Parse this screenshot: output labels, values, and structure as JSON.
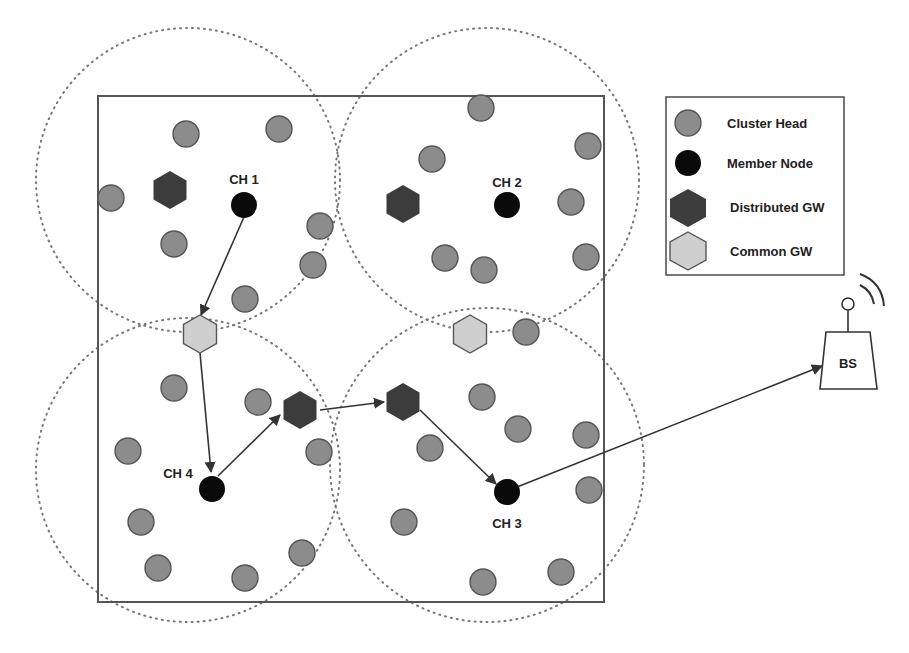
{
  "diagram": {
    "type": "wsn-cluster-routing",
    "field": {
      "x": 98,
      "y": 96,
      "w": 506,
      "h": 506
    },
    "colors": {
      "cluster_head": "#8c8c8c",
      "member_node": "#0a0a0a",
      "distributed_gw": "#3c3c3c",
      "common_gw": "#cfcfcf",
      "stroke": "#444444"
    },
    "ranges": [
      {
        "cx": 188,
        "cy": 180,
        "r": 152
      },
      {
        "cx": 487,
        "cy": 180,
        "r": 152
      },
      {
        "cx": 188,
        "cy": 470,
        "r": 152
      },
      {
        "cx": 487,
        "cy": 465,
        "r": 157
      }
    ],
    "gray_nodes": [
      [
        186,
        134
      ],
      [
        279,
        129
      ],
      [
        111,
        198
      ],
      [
        174,
        244
      ],
      [
        320,
        226
      ],
      [
        313,
        265
      ],
      [
        245,
        299
      ],
      [
        481,
        108
      ],
      [
        432,
        159
      ],
      [
        588,
        146
      ],
      [
        571,
        202
      ],
      [
        445,
        258
      ],
      [
        484,
        270
      ],
      [
        586,
        257
      ],
      [
        526,
        332
      ],
      [
        174,
        388
      ],
      [
        258,
        402
      ],
      [
        128,
        451
      ],
      [
        319,
        452
      ],
      [
        141,
        522
      ],
      [
        158,
        568
      ],
      [
        245,
        578
      ],
      [
        302,
        553
      ],
      [
        482,
        397
      ],
      [
        518,
        429
      ],
      [
        586,
        435
      ],
      [
        430,
        448
      ],
      [
        589,
        490
      ],
      [
        404,
        522
      ],
      [
        483,
        582
      ],
      [
        561,
        572
      ]
    ],
    "cluster_heads": [
      {
        "label": "CH 1",
        "x": 244,
        "y": 205,
        "lx": 244,
        "ly": 184
      },
      {
        "label": "CH 2",
        "x": 507,
        "y": 205,
        "lx": 507,
        "ly": 187
      },
      {
        "label": "CH 4",
        "x": 212,
        "y": 489,
        "lx": 178,
        "ly": 478
      },
      {
        "label": "CH 3",
        "x": 507,
        "y": 492,
        "lx": 507,
        "ly": 528
      }
    ],
    "distributed_gw": [
      [
        170,
        190
      ],
      [
        403,
        204
      ],
      [
        300,
        410
      ],
      [
        403,
        402
      ]
    ],
    "common_gw": [
      [
        200,
        334
      ],
      [
        470,
        334
      ]
    ],
    "base_station": {
      "label": "BS",
      "x": 848,
      "y": 362
    },
    "links": [
      [
        [
          244,
          217
        ],
        [
          201,
          315
        ]
      ],
      [
        [
          200,
          353
        ],
        [
          211,
          472
        ]
      ],
      [
        [
          218,
          476
        ],
        [
          280,
          415
        ]
      ],
      [
        [
          320,
          410
        ],
        [
          384,
          402
        ]
      ],
      [
        [
          420,
          410
        ],
        [
          496,
          484
        ]
      ],
      [
        [
          517,
          487
        ],
        [
          822,
          366
        ]
      ]
    ]
  },
  "legend": {
    "items": [
      {
        "label": "Cluster Head",
        "shape": "circle",
        "color": "#8c8c8c"
      },
      {
        "label": "Member Node",
        "shape": "circle",
        "color": "#0a0a0a"
      },
      {
        "label": "Distributed GW",
        "shape": "hexagon",
        "color": "#3c3c3c"
      },
      {
        "label": "Common GW",
        "shape": "hexagon",
        "color": "#cfcfcf"
      }
    ]
  }
}
